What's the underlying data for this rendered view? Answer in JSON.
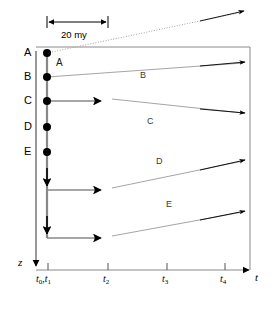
{
  "figure": {
    "type": "evolutionary-lineage-time-diagram",
    "scale_bar": {
      "label": "20 my",
      "x_start": 47,
      "x_end": 108
    },
    "axes": {
      "vertical": {
        "label": "z",
        "direction": "down",
        "x": 36,
        "y_top": 51,
        "y_bottom": 268
      },
      "horizontal": {
        "label": "t",
        "direction": "right",
        "y": 270,
        "x_start": 36,
        "x_end": 252,
        "ticks": [
          {
            "label": "t₀,t₁",
            "x": 48,
            "text_main": "t",
            "sub": "0,1"
          },
          {
            "label": "t₂",
            "x": 108,
            "text_main": "t",
            "sub": "2"
          },
          {
            "label": "t₃",
            "x": 167,
            "text_main": "t",
            "sub": "3"
          },
          {
            "label": "t₄",
            "x": 225,
            "text_main": "t",
            "sub": "4"
          }
        ]
      }
    },
    "frame": {
      "top_y": 47,
      "right_x": 250,
      "left_x": 36,
      "bottom_y": 270
    },
    "node_labels": [
      {
        "text": "A",
        "x": 24,
        "y": 49
      },
      {
        "text": "B",
        "x": 24,
        "y": 72
      },
      {
        "text": "C",
        "x": 24,
        "y": 96
      },
      {
        "text": "D",
        "x": 24,
        "y": 122
      },
      {
        "text": "E",
        "x": 24,
        "y": 147
      }
    ],
    "nodes": [
      {
        "name": "A",
        "cx": 47,
        "cy": 53
      },
      {
        "name": "B",
        "cx": 47,
        "cy": 77
      },
      {
        "name": "C",
        "cx": 47,
        "cy": 101
      },
      {
        "name": "D",
        "cx": 47,
        "cy": 127
      },
      {
        "name": "E",
        "cx": 47,
        "cy": 152
      }
    ],
    "branch_labels": [
      {
        "text": "A",
        "x": 56,
        "y": 62
      },
      {
        "text": "B",
        "x": 140,
        "y": 75
      },
      {
        "text": "C",
        "x": 147,
        "y": 121
      },
      {
        "text": "D",
        "x": 156,
        "y": 161
      },
      {
        "text": "E",
        "x": 166,
        "y": 204
      }
    ],
    "lineages": [
      {
        "name": "A",
        "kind": "diagonal-only",
        "from_x": 47,
        "from_y": 53,
        "to_x": 245,
        "to_y": 11,
        "crosses_frame": true
      },
      {
        "name": "B",
        "kind": "diagonal-only",
        "from_x": 47,
        "from_y": 77,
        "to_x": 245,
        "to_y": 62
      },
      {
        "name": "C",
        "kind": "horizontal-then-diagonal",
        "h_from_x": 47,
        "h_to_x": 108,
        "h_y": 101,
        "d_to_x": 245,
        "d_to_y": 112
      },
      {
        "name": "D",
        "kind": "horizontal-then-diagonal",
        "h_from_x": 47,
        "h_to_x": 108,
        "h_y": 190,
        "d_to_x": 245,
        "d_to_y": 160
      },
      {
        "name": "E",
        "kind": "horizontal-then-diagonal",
        "h_from_x": 47,
        "h_to_x": 108,
        "h_y": 238,
        "d_to_x": 245,
        "d_to_y": 211
      }
    ],
    "stem_arrows": [
      {
        "x": 47,
        "y": 185
      },
      {
        "x": 47,
        "y": 233
      }
    ]
  }
}
